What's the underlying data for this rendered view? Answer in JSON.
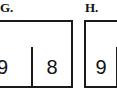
{
  "page": {
    "background_color": "#ffffff",
    "border_color": "#1a1a1a",
    "text_color": "#111111"
  },
  "panels": [
    {
      "id": "G",
      "label": "G.",
      "table": {
        "rows": [
          {
            "name": "top-row",
            "cells": [
              {
                "value": ""
              }
            ]
          },
          {
            "name": "bottom-row",
            "cells": [
              {
                "value": "9"
              },
              {
                "value": "8"
              }
            ]
          }
        ]
      }
    },
    {
      "id": "H",
      "label": "H.",
      "table": {
        "rows": [
          {
            "name": "top-row",
            "cells": [
              {
                "value": ""
              }
            ]
          },
          {
            "name": "bottom-row",
            "cells": [
              {
                "value": "9"
              },
              {
                "value": ""
              }
            ]
          }
        ]
      }
    }
  ]
}
